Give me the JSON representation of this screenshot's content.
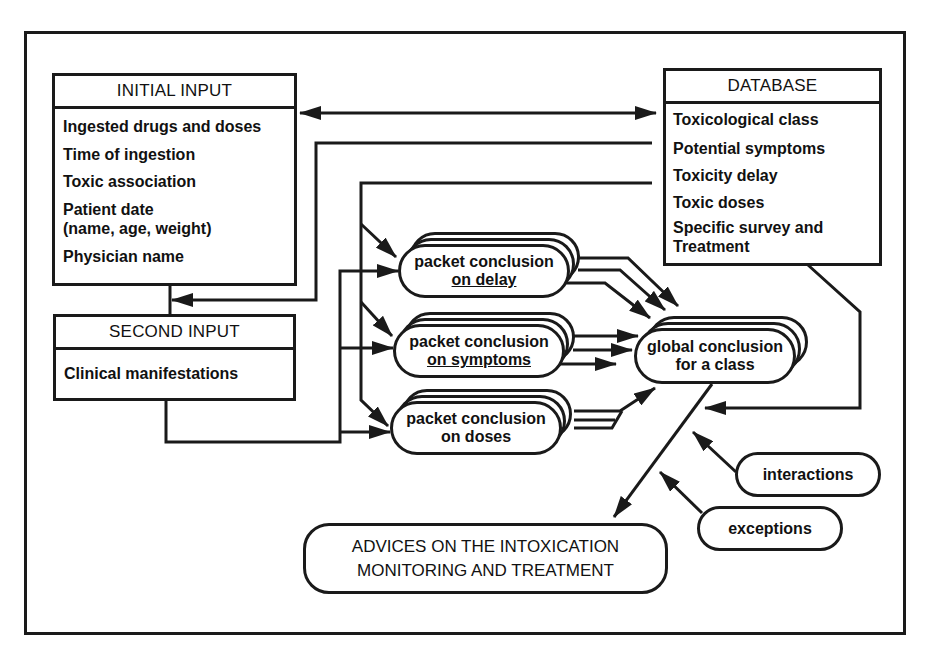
{
  "diagram": {
    "initial_input": {
      "title": "INITIAL INPUT",
      "items": [
        "Ingested drugs and doses",
        "Time of ingestion",
        "Toxic association",
        "Patient date",
        "(name, age, weight)",
        "Physician name"
      ]
    },
    "second_input": {
      "title": "SECOND INPUT",
      "items": [
        "Clinical manifestations"
      ]
    },
    "database": {
      "title": "DATABASE",
      "items": [
        "Toxicological class",
        "Potential symptoms",
        "Toxicity delay",
        "Toxic doses",
        "Specific survey and",
        "Treatment"
      ]
    },
    "packets": [
      {
        "line1": "packet conclusion",
        "line2": "on delay"
      },
      {
        "line1": "packet conclusion",
        "line2": "on symptoms"
      },
      {
        "line1": "packet conclusion",
        "line2": "on doses"
      }
    ],
    "global": {
      "line1": "global conclusion",
      "line2": "for a class"
    },
    "modifiers": {
      "interactions": "interactions",
      "exceptions": "exceptions"
    },
    "output": {
      "line1": "ADVICES ON THE INTOXICATION",
      "line2": "MONITORING AND TREATMENT"
    },
    "edges": [
      {
        "from": "initial_input",
        "to": "database",
        "type": "bidirectional"
      },
      {
        "from": "database.potential_symptoms",
        "to": "input_connector",
        "type": "arrow"
      },
      {
        "from": "database.toxicity_delay",
        "to": "packets",
        "type": "arrows"
      },
      {
        "from": "inputs",
        "to": "packets",
        "type": "arrows"
      },
      {
        "from": "packets",
        "to": "global",
        "type": "arrows"
      },
      {
        "from": "database",
        "to": "global",
        "type": "arrow"
      },
      {
        "from": "interactions",
        "to": "global_output_link",
        "type": "arrow"
      },
      {
        "from": "exceptions",
        "to": "global_output_link",
        "type": "arrow"
      },
      {
        "from": "global",
        "to": "output",
        "type": "arrow"
      }
    ]
  }
}
